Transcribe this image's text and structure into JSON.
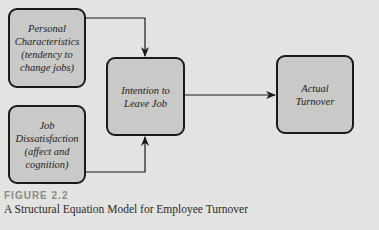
{
  "diagram": {
    "type": "structural-equation-model",
    "nodes": [
      {
        "id": "personal",
        "lines": [
          "Personal",
          "Characteristics",
          "(tendency to",
          "change jobs)"
        ]
      },
      {
        "id": "dissatisfaction",
        "lines": [
          "Job",
          "Dissatisfaction",
          "(affect and",
          "cognition)"
        ]
      },
      {
        "id": "intention",
        "lines": [
          "Intention to",
          "Leave Job"
        ]
      },
      {
        "id": "turnover",
        "lines": [
          "Actual",
          "Turnover"
        ]
      }
    ],
    "edges": [
      {
        "from": "personal",
        "to": "intention"
      },
      {
        "from": "dissatisfaction",
        "to": "intention"
      },
      {
        "from": "intention",
        "to": "turnover"
      }
    ],
    "colors": {
      "background": "#e3e3e1",
      "node_fill": "#c9c9c7",
      "stroke": "#1a1a1a",
      "figure_label": "#8a8a88"
    }
  },
  "caption": {
    "label": "FIGURE 2.2",
    "text": "A Structural Equation Model for Employee Turnover"
  }
}
